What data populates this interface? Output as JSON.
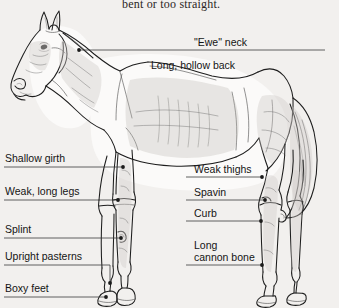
{
  "page": {
    "caption": "bent or too straight.",
    "background_color": "#f2f0ee",
    "ink_color": "#1a1a1a",
    "leader_color": "#3a3a3a"
  },
  "figure": {
    "view": "left-side-profile"
  },
  "labels": {
    "ewe_neck": "\"Ewe\" neck",
    "hollow_back": "Long, hollow back",
    "shallow_girth": "Shallow girth",
    "weak_long_legs": "Weak, long legs",
    "splint": "Splint",
    "upright_pasterns": "Upright pasterns",
    "boxy_feet": "Boxy feet",
    "weak_thighs": "Weak thighs",
    "spavin": "Spavin",
    "curb": "Curb",
    "cannon_line1": "Long",
    "cannon_line2": "cannon bone"
  }
}
